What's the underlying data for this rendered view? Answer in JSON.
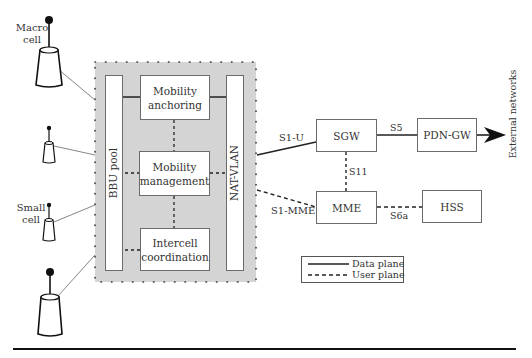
{
  "cells": {
    "macro_cell_label": "Macro\ncell",
    "macro_line1": "Macro",
    "macro_line2": "cell",
    "small_line1": "Small",
    "small_line2": "cell"
  },
  "cloud": {
    "bbu_pool": "BBU pool",
    "nat_vlan": "NAT-VLAN",
    "mobility_anchoring_1": "Mobility",
    "mobility_anchoring_2": "anchoring",
    "mobility_management_1": "Mobility",
    "mobility_management_2": "management",
    "intercell_1": "Intercell",
    "intercell_2": "coordination"
  },
  "core": {
    "sgw": "SGW",
    "pdn_gw": "PDN-GW",
    "mme": "MME",
    "hss": "HSS",
    "external": "External networks"
  },
  "interfaces": {
    "s1u": "S1-U",
    "s5": "S5",
    "s11": "S11",
    "s1mme": "S1-MME",
    "s6a": "S6a"
  },
  "legend": {
    "data_plane": "Data plane",
    "user_plane": "User plane"
  },
  "colors": {
    "cloud_fill": "#d4d4d4",
    "line": "#222222",
    "box_border": "#6b6b6b"
  }
}
